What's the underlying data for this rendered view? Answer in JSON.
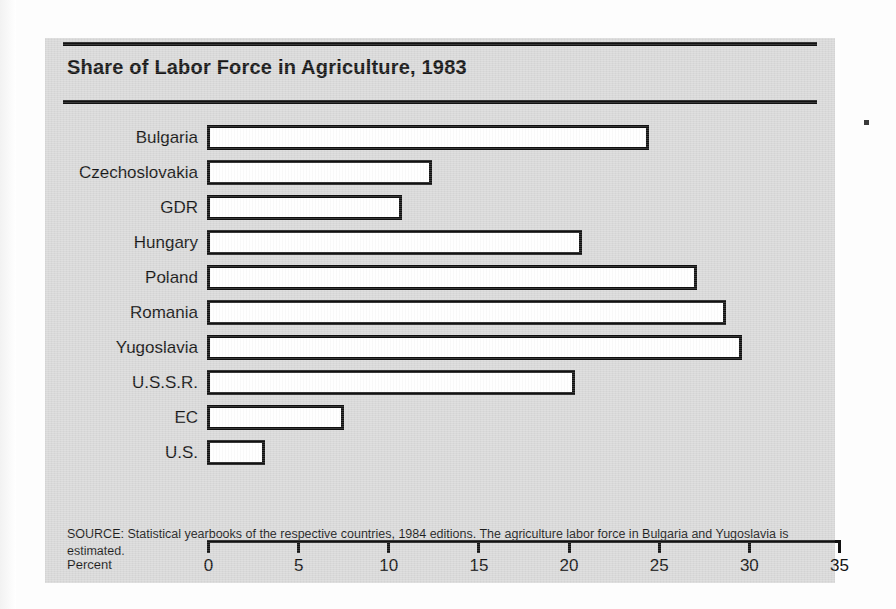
{
  "figure": {
    "title": "Share of Labor Force in Agriculture, 1983",
    "axis_name": "Percent",
    "source_note": "SOURCE: Statistical yearbooks of the respective countries, 1984 editions. The agriculture labor force in Bulgaria and Yugoslavia is estimated.",
    "panel_color": "#d9d9d9",
    "bar_fill_color": "#ffffff",
    "bar_outline_color": "#111111",
    "rule_color": "#111111"
  },
  "chart_data": {
    "type": "bar",
    "orientation": "horizontal",
    "title": "Share of Labor Force in Agriculture, 1983",
    "xlabel": "Percent",
    "ylabel": "",
    "xlim": [
      0,
      35
    ],
    "xticks": [
      0,
      5,
      10,
      15,
      20,
      25,
      30,
      35
    ],
    "xtick_labels": [
      "0",
      "5",
      "10",
      "15",
      "20",
      "25",
      "30",
      "35"
    ],
    "grid": false,
    "legend": false,
    "categories": [
      "Bulgaria",
      "Czechoslovakia",
      "GDR",
      "Hungary",
      "Poland",
      "Romania",
      "Yugoslavia",
      "U.S.S.R.",
      "EC",
      "U.S."
    ],
    "values": [
      24.5,
      12.5,
      10.8,
      20.8,
      27.2,
      28.8,
      29.7,
      20.4,
      7.6,
      3.2
    ],
    "annotations": [
      "The agriculture labor force in Bulgaria and Yugoslavia is estimated."
    ]
  }
}
